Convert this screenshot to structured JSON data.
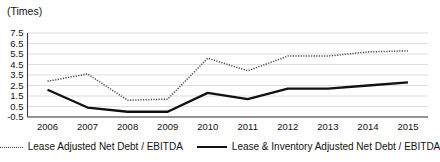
{
  "chart_data": {
    "type": "line",
    "title": "",
    "subtitle": "",
    "xlabel": "",
    "ylabel": "(Times)",
    "unit_label": "(Times)",
    "categories": [
      "2006",
      "2007",
      "2008",
      "2009",
      "2010",
      "2011",
      "2012",
      "2013",
      "2014",
      "2015"
    ],
    "x": [
      2006,
      2007,
      2008,
      2009,
      2010,
      2011,
      2012,
      2013,
      2014,
      2015
    ],
    "ylim": [
      -0.5,
      7.5
    ],
    "ytick_labels": [
      "7.5",
      "6.5",
      "5.5",
      "4.5",
      "3.5",
      "2.5",
      "1.5",
      "0.5",
      "-0.5"
    ],
    "yticks": [
      7.5,
      6.5,
      5.5,
      4.5,
      3.5,
      2.5,
      1.5,
      0.5,
      -0.5
    ],
    "grid": true,
    "legend_position": "bottom",
    "series": [
      {
        "name": "Lease Adjusted Net Debt / EBITDA",
        "style": "dotted",
        "color": "#4a4a4a",
        "values": [
          2.9,
          3.6,
          1.1,
          1.2,
          5.1,
          3.9,
          5.3,
          5.3,
          5.7,
          5.8
        ]
      },
      {
        "name": "Lease & Inventory Adjusted Net Debt / EBITDA",
        "style": "solid",
        "color": "#111111",
        "values": [
          2.1,
          0.4,
          0.0,
          0.0,
          1.8,
          1.2,
          2.2,
          2.2,
          2.5,
          2.8
        ]
      }
    ]
  },
  "legend": {
    "items": [
      {
        "label": "Lease Adjusted Net Debt / EBITDA",
        "style": "dotted"
      },
      {
        "label": "Lease & Inventory Adjusted Net Debt / EBITDA",
        "style": "solid"
      }
    ]
  }
}
